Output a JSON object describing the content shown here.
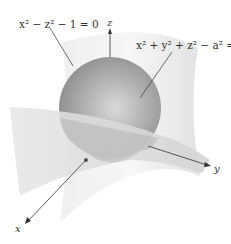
{
  "diagram": {
    "equations": {
      "cylinder": "x² − z² − 1 = 0",
      "sphere": "x² + y² + z² − a² = 0"
    },
    "axes": {
      "x": "x",
      "y": "y",
      "z": "z"
    },
    "colors": {
      "sphere": "#9a9a9a",
      "surface": "#e8e8e8",
      "axis": "#333333"
    }
  }
}
